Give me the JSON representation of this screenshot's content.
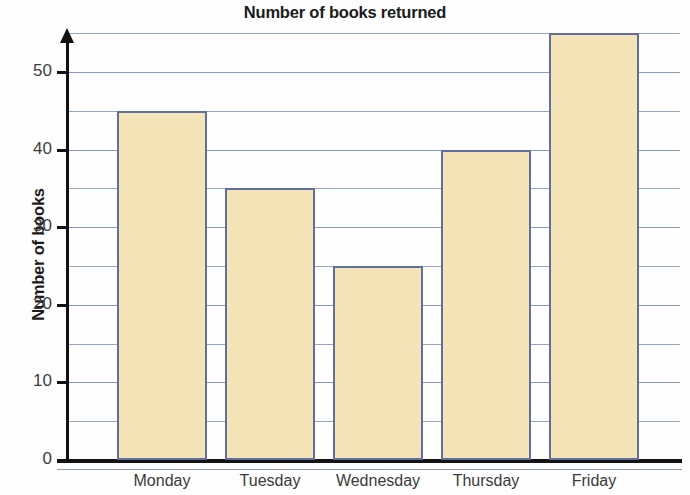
{
  "chart_data": {
    "type": "bar",
    "title": "Number of books returned",
    "xlabel": "",
    "ylabel": "Number of books",
    "categories": [
      "Monday",
      "Tuesday",
      "Wednesday",
      "Thursday",
      "Friday"
    ],
    "values": [
      45,
      35,
      25,
      40,
      55
    ],
    "ylim": [
      0,
      57
    ],
    "y_major_ticks": [
      0,
      10,
      20,
      30,
      40,
      50
    ],
    "y_minor_ticks": [
      5,
      15,
      25,
      35,
      45,
      55
    ],
    "y_tick_labels": [
      "0",
      "10",
      "20",
      "30",
      "40",
      "50"
    ],
    "grid": true,
    "legend": false,
    "colors": {
      "bar_fill": "#F5E4B8",
      "bar_border": "#5F6FA0",
      "gridline": "#8A9BBF",
      "axis": "#121212",
      "text": "#1B1B1B",
      "tick_text": "#3D3D3D"
    }
  }
}
